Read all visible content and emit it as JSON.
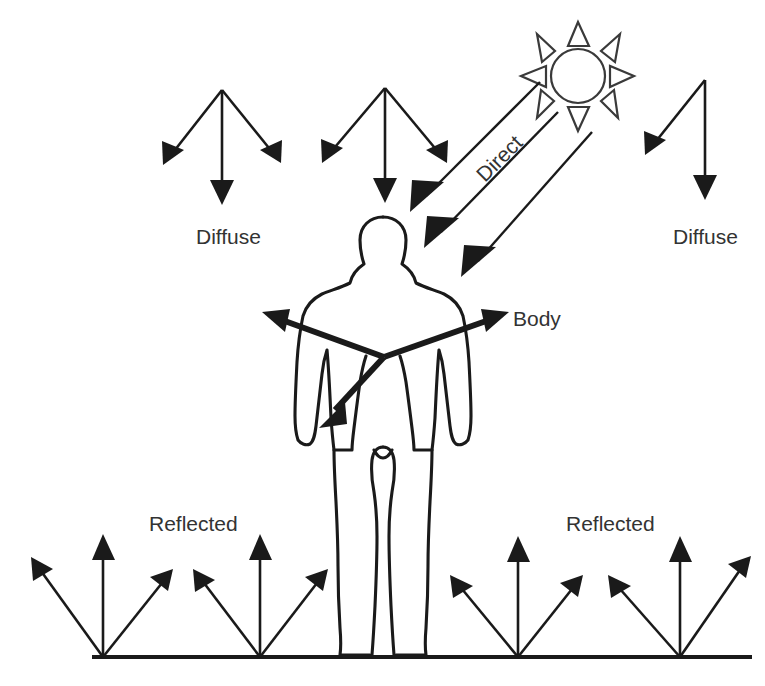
{
  "diagram": {
    "background_color": "#ffffff",
    "ink_color": "#1a1a1a",
    "text_color": "#333333",
    "labels": {
      "diffuse_left": "Diffuse",
      "diffuse_right": "Diffuse",
      "direct": "Direct",
      "body": "Body",
      "reflected_left": "Reflected",
      "reflected_right": "Reflected"
    },
    "elements": {
      "sun_name": "sun",
      "person_name": "human-figure",
      "ground_name": "ground-line"
    },
    "sun": {
      "center_x": 578,
      "center_y": 76,
      "radius": 27,
      "ray_count": 8
    },
    "ground": {
      "x1": 92,
      "y1": 657,
      "x2": 752,
      "y2": 657
    },
    "diffuse_groups": [
      {
        "name": "diffuse-left",
        "apex_x": 222,
        "apex_y": 90,
        "arrows": [
          {
            "tip_x": 163,
            "tip_y": 165
          },
          {
            "tip_x": 222,
            "tip_y": 205
          },
          {
            "tip_x": 281,
            "tip_y": 163
          }
        ],
        "label_x": 196,
        "label_y": 238
      },
      {
        "name": "diffuse-middle",
        "apex_x": 385,
        "apex_y": 88,
        "arrows": [
          {
            "tip_x": 322,
            "tip_y": 163
          },
          {
            "tip_x": 385,
            "tip_y": 203
          },
          {
            "tip_x": 447,
            "tip_y": 163
          }
        ],
        "label_x": null,
        "label_y": null
      },
      {
        "name": "diffuse-right",
        "apex_x": 705,
        "apex_y": 80,
        "arrows": [
          {
            "tip_x": 645,
            "tip_y": 155
          },
          {
            "tip_x": 705,
            "tip_y": 200
          }
        ],
        "label_x": 673,
        "label_y": 238
      }
    ],
    "direct_rays": [
      {
        "start_x": 540,
        "start_y": 82,
        "tip_x": 415,
        "tip_y": 207
      },
      {
        "start_x": 556,
        "start_y": 110,
        "tip_x": 430,
        "tip_y": 243
      },
      {
        "start_x": 588,
        "start_y": 130,
        "tip_x": 467,
        "tip_y": 272
      }
    ],
    "direct_label": {
      "x": 485,
      "y": 183,
      "rotation_deg": -45
    },
    "body_rays": {
      "origin_x": 384,
      "origin_y": 357,
      "arrows": [
        {
          "tip_x": 265,
          "tip_y": 313
        },
        {
          "tip_x": 506,
          "tip_y": 313
        },
        {
          "tip_x": 323,
          "tip_y": 425
        }
      ],
      "label_x": 513,
      "label_y": 320
    },
    "reflected_groups": [
      {
        "name": "reflected-base-1",
        "base_x": 103,
        "base_y": 657,
        "arrows": [
          {
            "tip_x": 33,
            "tip_y": 560
          },
          {
            "tip_x": 103,
            "tip_y": 536
          },
          {
            "tip_x": 170,
            "tip_y": 572
          }
        ]
      },
      {
        "name": "reflected-base-2",
        "base_x": 260,
        "base_y": 657,
        "arrows": [
          {
            "tip_x": 196,
            "tip_y": 572
          },
          {
            "tip_x": 260,
            "tip_y": 536
          },
          {
            "tip_x": 325,
            "tip_y": 572
          }
        ]
      },
      {
        "name": "reflected-base-3",
        "base_x": 518,
        "base_y": 657,
        "arrows": [
          {
            "tip_x": 452,
            "tip_y": 578
          },
          {
            "tip_x": 518,
            "tip_y": 538
          },
          {
            "tip_x": 580,
            "tip_y": 578
          }
        ]
      },
      {
        "name": "reflected-base-4",
        "base_x": 680,
        "base_y": 657,
        "arrows": [
          {
            "tip_x": 608,
            "tip_y": 578
          },
          {
            "tip_x": 680,
            "tip_y": 538
          },
          {
            "tip_x": 748,
            "tip_y": 560
          }
        ]
      }
    ],
    "reflected_label_left": {
      "x": 149,
      "y": 525
    },
    "reflected_label_right": {
      "x": 566,
      "y": 525
    }
  }
}
